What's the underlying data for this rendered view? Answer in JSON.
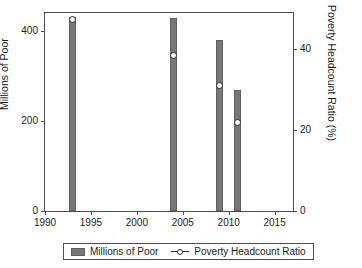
{
  "chart_data": {
    "type": "bar",
    "title": "",
    "xlabel": "",
    "ylabel": "Millions of Poor",
    "y2label": "Poverty Headcount Ratio (%)",
    "x": [
      1993,
      2004,
      2009,
      2011
    ],
    "xlim": [
      1990,
      2017
    ],
    "ylim": [
      0,
      440
    ],
    "y2lim": [
      0,
      49
    ],
    "grid": false,
    "legend_position": "below-center",
    "xticks": [
      "1990",
      "1995",
      "2000",
      "2005",
      "2010",
      "2015"
    ],
    "xtick_values": [
      1990,
      1995,
      2000,
      2005,
      2010,
      2015
    ],
    "yticks_left": [
      "0",
      "200",
      "400"
    ],
    "ytick_values_left": [
      0,
      200,
      400
    ],
    "yticks_right": [
      "0",
      "20",
      "40"
    ],
    "ytick_values_right": [
      0,
      20,
      40
    ],
    "series": [
      {
        "name": "Millions of Poor",
        "type": "bar",
        "axis": "left",
        "color": "#787878",
        "values": [
          432,
          430,
          381,
          270
        ]
      },
      {
        "name": "Poverty Headcount Ratio",
        "type": "line-marker",
        "axis": "right",
        "color": "#2b2b2b",
        "values": [
          47.5,
          38.4,
          31.0,
          21.9
        ]
      }
    ]
  },
  "axes": {
    "left_title": "Millions of Poor",
    "right_title": "Poverty Headcount Ratio (%)"
  },
  "legend": {
    "items": [
      {
        "label": "Millions of Poor",
        "glyph": "bar-swatch"
      },
      {
        "label": "Poverty Headcount Ratio",
        "glyph": "line-marker-swatch"
      }
    ]
  }
}
